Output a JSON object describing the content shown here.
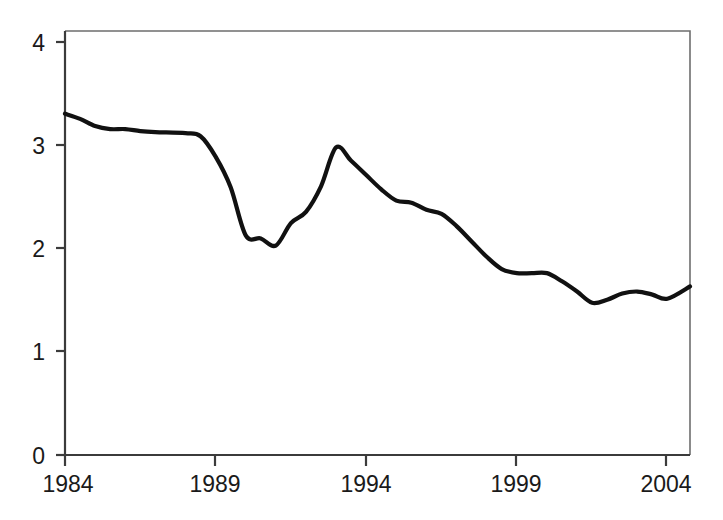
{
  "chart_data": {
    "type": "line",
    "title": "",
    "subtitle": "",
    "xlabel": "",
    "ylabel": "",
    "xlim": [
      1984,
      2004.75
    ],
    "ylim": [
      0,
      4.15
    ],
    "grid": false,
    "legend": null,
    "x_ticks": [
      1984,
      1989,
      1994,
      1999,
      2004
    ],
    "x_tick_labels": [
      "1984",
      "1989",
      "1994",
      "1999",
      "2004"
    ],
    "y_ticks": [
      0,
      1,
      2,
      3,
      4
    ],
    "y_tick_labels": [
      "0",
      "1",
      "2",
      "3",
      "4"
    ],
    "series": [
      {
        "name": "series-1",
        "color": "#111111",
        "x": [
          1984,
          1984.5,
          1985,
          1985.5,
          1986,
          1986.5,
          1987,
          1988,
          1988.5,
          1989,
          1989.5,
          1990,
          1990.5,
          1991,
          1991.5,
          1992,
          1992.5,
          1993,
          1993.5,
          1994,
          1994.5,
          1995,
          1995.5,
          1996,
          1996.5,
          1997,
          1997.5,
          1998,
          1998.5,
          1999,
          1999.5,
          2000,
          2000.5,
          2001,
          2001.5,
          2002,
          2002.5,
          2003,
          2003.5,
          2004,
          2004.75
        ],
        "values": [
          3.34,
          3.29,
          3.22,
          3.19,
          3.19,
          3.17,
          3.16,
          3.15,
          3.12,
          2.92,
          2.62,
          2.15,
          2.12,
          2.05,
          2.27,
          2.38,
          2.63,
          3.01,
          2.88,
          2.74,
          2.6,
          2.49,
          2.47,
          2.4,
          2.36,
          2.24,
          2.09,
          1.94,
          1.82,
          1.78,
          1.78,
          1.78,
          1.7,
          1.6,
          1.49,
          1.52,
          1.58,
          1.6,
          1.57,
          1.53,
          1.65
        ]
      }
    ]
  },
  "axes": {
    "x_axis_name": "x-axis",
    "y_axis_name": "y-axis"
  }
}
